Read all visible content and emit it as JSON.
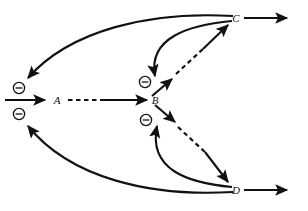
{
  "figure": {
    "type": "network-diagram",
    "title": "",
    "background_color": "#ffffff",
    "stroke_color": "#111111",
    "width": 308,
    "height": 211
  },
  "nodes": [
    {
      "id": "A",
      "label": "A",
      "x": 57,
      "y": 100
    },
    {
      "id": "B",
      "label": "B",
      "x": 155,
      "y": 100
    },
    {
      "id": "C",
      "label": "C",
      "x": 234,
      "y": 18
    },
    {
      "id": "D",
      "label": "D",
      "x": 234,
      "y": 190
    }
  ],
  "inhibition_markers": [
    {
      "id": "minus-A-upper",
      "symbol": "circled-minus",
      "label": "-",
      "x": 19,
      "y": 88,
      "target": "A"
    },
    {
      "id": "minus-A-lower",
      "symbol": "circled-minus",
      "label": "-",
      "x": 19,
      "y": 114,
      "target": "A"
    },
    {
      "id": "minus-B-upper",
      "symbol": "circled-minus",
      "label": "-",
      "x": 145,
      "y": 82,
      "target": "B"
    },
    {
      "id": "minus-B-lower",
      "symbol": "circled-minus",
      "label": "-",
      "x": 146,
      "y": 120,
      "target": "B"
    }
  ],
  "edges": [
    {
      "id": "input-to-A",
      "from": "input",
      "to": "A",
      "style": "solid",
      "arrow": true
    },
    {
      "id": "A-to-B",
      "from": "A",
      "to": "B",
      "style": "dashed-solid",
      "arrow": true
    },
    {
      "id": "B-to-C",
      "from": "B",
      "to": "C",
      "style": "solid-dashed-solid",
      "arrow": true
    },
    {
      "id": "B-to-D",
      "from": "B",
      "to": "D",
      "style": "solid-dashed-solid",
      "arrow": true
    },
    {
      "id": "C-output",
      "from": "C",
      "to": "output",
      "style": "solid",
      "arrow": true
    },
    {
      "id": "D-output",
      "from": "D",
      "to": "output",
      "style": "solid",
      "arrow": true
    },
    {
      "id": "C-inhibits-A",
      "from": "C",
      "to": "A",
      "style": "curved",
      "arrow": true,
      "sign": "negative"
    },
    {
      "id": "C-inhibits-B",
      "from": "C",
      "to": "B",
      "style": "curved",
      "arrow": true,
      "sign": "negative"
    },
    {
      "id": "D-inhibits-A",
      "from": "D",
      "to": "A",
      "style": "curved",
      "arrow": true,
      "sign": "negative"
    },
    {
      "id": "D-inhibits-B",
      "from": "D",
      "to": "B",
      "style": "curved",
      "arrow": true,
      "sign": "negative"
    }
  ]
}
